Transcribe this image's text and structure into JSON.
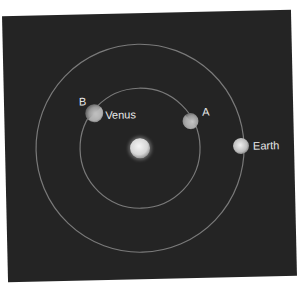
{
  "diagram": {
    "title": "",
    "background_color": "#242424",
    "orbit_color": "#7a7a7a",
    "sun": {
      "label": "",
      "cx": 140,
      "cy": 148,
      "r": 10
    },
    "orbits": [
      {
        "name": "Venus orbit",
        "cx": 140,
        "cy": 148,
        "r": 60
      },
      {
        "name": "Earth orbit",
        "cx": 140,
        "cy": 148,
        "r": 104
      }
    ],
    "bodies": [
      {
        "name": "Venus",
        "position_label": "B",
        "cx": 95,
        "cy": 112,
        "r": 9
      },
      {
        "name": "",
        "position_label": "A",
        "cx": 191,
        "cy": 122,
        "r": 8
      },
      {
        "name": "Earth",
        "position_label": "",
        "cx": 241,
        "cy": 148,
        "r": 8
      }
    ],
    "labels": {
      "b": "B",
      "venus": "Venus",
      "a": "A",
      "earth": "Earth"
    }
  }
}
